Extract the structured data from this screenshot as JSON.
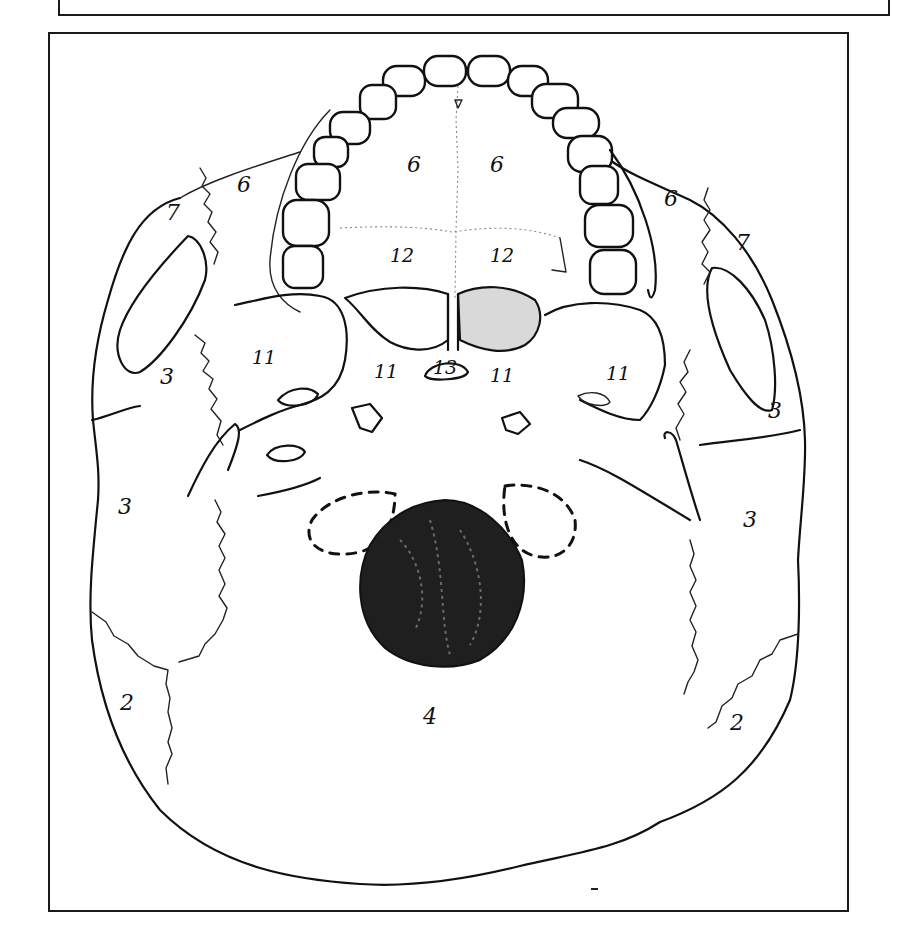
{
  "figure": {
    "type": "anatomical line drawing",
    "colors": {
      "line": "#111111",
      "foramen_fill": "#1a1a1a",
      "background": "#ffffff",
      "shaded_region": "#bdbdbd"
    },
    "labels": [
      {
        "id": "label-6-left-palatine",
        "text": "6",
        "x": 412,
        "y": 172
      },
      {
        "id": "label-6-right-palatine",
        "text": "6",
        "x": 490,
        "y": 172
      },
      {
        "id": "label-6-left-lateral",
        "text": "6",
        "x": 240,
        "y": 190
      },
      {
        "id": "label-6-right-lateral",
        "text": "6",
        "x": 666,
        "y": 205
      },
      {
        "id": "label-7-left",
        "text": "7",
        "x": 170,
        "y": 218
      },
      {
        "id": "label-7-right",
        "text": "7",
        "x": 738,
        "y": 248
      },
      {
        "id": "label-12-left",
        "text": "12",
        "x": 395,
        "y": 260
      },
      {
        "id": "label-12-right",
        "text": "12",
        "x": 490,
        "y": 260
      },
      {
        "id": "label-11-far-left",
        "text": "11",
        "x": 255,
        "y": 362
      },
      {
        "id": "label-11-center-left",
        "text": "11",
        "x": 377,
        "y": 375
      },
      {
        "id": "label-13",
        "text": "13",
        "x": 433,
        "y": 373
      },
      {
        "id": "label-11-center-right",
        "text": "11",
        "x": 491,
        "y": 379
      },
      {
        "id": "label-11-far-right",
        "text": "11",
        "x": 608,
        "y": 378
      },
      {
        "id": "label-3-left-upper",
        "text": "3",
        "x": 163,
        "y": 380
      },
      {
        "id": "label-3-right-upper",
        "text": "3",
        "x": 770,
        "y": 416
      },
      {
        "id": "label-3-left-lower",
        "text": "3",
        "x": 120,
        "y": 512
      },
      {
        "id": "label-3-right-lower",
        "text": "3",
        "x": 745,
        "y": 525
      },
      {
        "id": "label-2-left",
        "text": "2",
        "x": 120,
        "y": 708
      },
      {
        "id": "label-2-right",
        "text": "2",
        "x": 732,
        "y": 728
      },
      {
        "id": "label-4",
        "text": "4",
        "x": 425,
        "y": 720
      }
    ]
  }
}
